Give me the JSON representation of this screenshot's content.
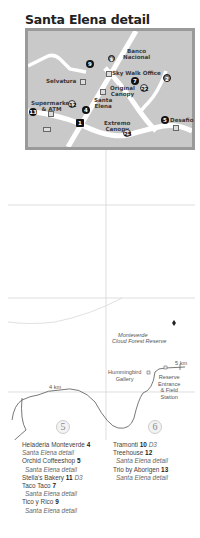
{
  "title": "Santa Elena detail",
  "inset": {
    "labels": {
      "banco": "Banco\nNacional",
      "skywalk": "Sky Walk Office",
      "selvatura": "Selvatura",
      "original": "Original\nCanopy",
      "supermarket": "Supermarket\n& ATM",
      "santa_elena": "Santa\nElena",
      "extremo": "Extremo\nCanopy",
      "desafio": "Desafio"
    },
    "markers": {
      "m9": "9",
      "m7": "7",
      "m2": "2",
      "m22": "22",
      "m12": "12",
      "m13": "13",
      "m4": "4",
      "m1": "1",
      "m5": "5",
      "m25": "25",
      "bank": "$"
    }
  },
  "map": {
    "reserve_label_line1": "Monteverde",
    "reserve_label_line2": "Cloud Forest Reserve",
    "hummingbird": "Hummingbird\nGallery",
    "reserve_entrance": "Reserve\nEntrance\n& Field\nStation",
    "km5": "5 km",
    "km4": "4 km",
    "grid_5": "5",
    "grid_6": "6"
  },
  "index": {
    "left": [
      {
        "name": "Heladeria Monteverde",
        "num": "4",
        "ref": ""
      },
      {
        "sub": "Santa Elena detail"
      },
      {
        "name": "Orchid Coffeeshop",
        "num": "5",
        "ref": ""
      },
      {
        "sub": "Santa Elena detail"
      },
      {
        "name": "Stella's Bakery",
        "num": "11",
        "ref": "D3"
      },
      {
        "name": "Taco Taco",
        "num": "7",
        "ref": ""
      },
      {
        "sub": "Santa Elena detail"
      },
      {
        "name": "Tico y Rico",
        "num": "9",
        "ref": ""
      },
      {
        "sub": "Santa Elena detail"
      }
    ],
    "right": [
      {
        "name": "Tramonti",
        "num": "10",
        "ref": "D3"
      },
      {
        "name": "Treehouse",
        "num": "12",
        "ref": ""
      },
      {
        "sub": "Santa Elena detail"
      },
      {
        "name": "Trio by Aborigen",
        "num": "13",
        "ref": ""
      },
      {
        "sub": "Santa Elena detail"
      }
    ]
  },
  "colors": {
    "inset_bg": "#c9c9c9",
    "inset_border": "#9a9a9a",
    "road": "#ffffff",
    "grid_line": "#d0d0d0",
    "trail": "#555555"
  }
}
